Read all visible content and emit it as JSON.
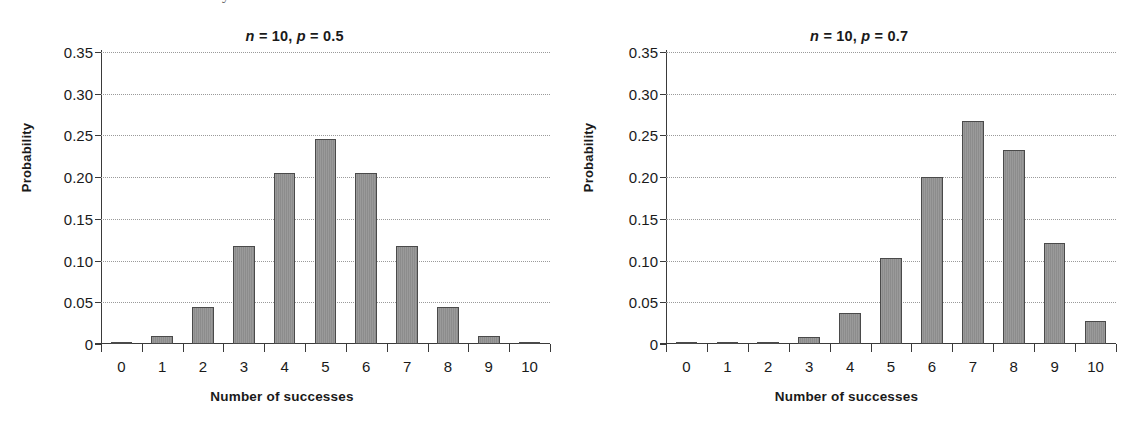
{
  "figure": {
    "caption_remnant": "y",
    "background": "#ffffff",
    "bar_fill": "#919191",
    "bar_stroke": "#4a4a4a",
    "grid_color": "#9a9a9a",
    "axis_color": "#3a3a3a"
  },
  "panels": [
    {
      "id": "left",
      "title_prefix": "n",
      "title_middle": " = 10, ",
      "title_var2": "p",
      "title_suffix": " = 0.5",
      "title_full": "n = 10, p = 0.5"
    },
    {
      "id": "right",
      "title_prefix": "n",
      "title_middle": " = 10, ",
      "title_var2": "p",
      "title_suffix": " = 0.7",
      "title_full": "n = 10, p = 0.7"
    }
  ],
  "axes": {
    "ylabel": "Probability",
    "xlabel": "Number of successes",
    "yticks": [
      "0.35",
      "0.30",
      "0.25",
      "0.20",
      "0.15",
      "0.10",
      "0.05",
      "0"
    ],
    "ytick_values": [
      0.35,
      0.3,
      0.25,
      0.2,
      0.15,
      0.1,
      0.05,
      0
    ],
    "xticks": [
      "0",
      "1",
      "2",
      "3",
      "4",
      "5",
      "6",
      "7",
      "8",
      "9",
      "10"
    ],
    "ylim": [
      0,
      0.35
    ],
    "grid": true,
    "legend": "none"
  },
  "chart_data": [
    {
      "type": "bar",
      "title": "n = 10, p = 0.5",
      "xlabel": "Number of successes",
      "ylabel": "Probability",
      "categories": [
        "0",
        "1",
        "2",
        "3",
        "4",
        "5",
        "6",
        "7",
        "8",
        "9",
        "10"
      ],
      "values": [
        0.001,
        0.01,
        0.044,
        0.117,
        0.205,
        0.246,
        0.205,
        0.117,
        0.044,
        0.01,
        0.001
      ],
      "ylim": [
        0,
        0.35
      ],
      "ytick_values": [
        0,
        0.05,
        0.1,
        0.15,
        0.2,
        0.25,
        0.3,
        0.35
      ],
      "grid": true,
      "legend_position": "none",
      "distribution": "Binomial n = 10, p = 0.5"
    },
    {
      "type": "bar",
      "title": "n = 10, p = 0.7",
      "xlabel": "Number of successes",
      "ylabel": "Probability",
      "categories": [
        "0",
        "1",
        "2",
        "3",
        "4",
        "5",
        "6",
        "7",
        "8",
        "9",
        "10"
      ],
      "values": [
        6e-06,
        0.000138,
        0.0014,
        0.009,
        0.037,
        0.103,
        0.2,
        0.267,
        0.233,
        0.121,
        0.028
      ],
      "ylim": [
        0,
        0.35
      ],
      "ytick_values": [
        0,
        0.05,
        0.1,
        0.15,
        0.2,
        0.25,
        0.3,
        0.35
      ],
      "grid": true,
      "legend_position": "none",
      "distribution": "Binomial n = 10, p = 0.7"
    }
  ]
}
